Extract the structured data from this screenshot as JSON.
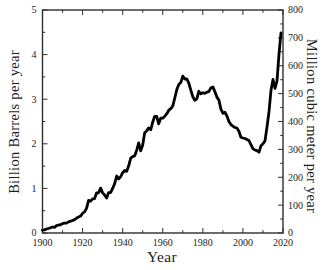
{
  "figure": {
    "xlabel": "Year",
    "ylabel_left": "Billion Barrels per year",
    "ylabel_right": "Million cubic meter per year",
    "colors": {
      "line": "#000000",
      "axis": "#2e2e2e",
      "text": "#1c1c1c",
      "background": "#ffffff"
    }
  },
  "chart_data": {
    "type": "line",
    "title": "",
    "xlabel": "Year",
    "ylabel_left": "Billion Barrels per year",
    "ylabel_right": "Million cubic meter per year",
    "xlim": [
      1900,
      2020
    ],
    "ylim_left": [
      0,
      5
    ],
    "ylim_right": [
      0,
      800
    ],
    "x_major_ticks": [
      1900,
      1920,
      1940,
      1960,
      1980,
      2000,
      2020
    ],
    "x_minor_step": 10,
    "left_major_ticks": [
      0,
      1,
      2,
      3,
      4,
      5
    ],
    "left_minor_step": 0.5,
    "right_major_ticks": [
      0,
      100,
      200,
      300,
      400,
      500,
      600,
      700,
      800
    ],
    "right_minor_step": 50,
    "grid": false,
    "legend": null,
    "series": [
      {
        "name": "oil-production",
        "x_start": 1900,
        "x_step": 1,
        "x_end": 2019,
        "values": [
          0.063,
          0.069,
          0.089,
          0.1,
          0.117,
          0.135,
          0.126,
          0.166,
          0.179,
          0.183,
          0.21,
          0.22,
          0.223,
          0.248,
          0.266,
          0.281,
          0.301,
          0.335,
          0.356,
          0.378,
          0.443,
          0.472,
          0.557,
          0.732,
          0.714,
          0.764,
          0.771,
          0.901,
          0.902,
          1.007,
          0.898,
          0.851,
          0.785,
          0.906,
          0.908,
          0.997,
          1.1,
          1.279,
          1.214,
          1.265,
          1.353,
          1.402,
          1.386,
          1.506,
          1.678,
          1.714,
          1.734,
          1.857,
          2.02,
          1.842,
          1.974,
          2.248,
          2.29,
          2.357,
          2.315,
          2.484,
          2.617,
          2.617,
          2.449,
          2.575,
          2.575,
          2.622,
          2.676,
          2.753,
          2.787,
          2.849,
          3.028,
          3.216,
          3.329,
          3.372,
          3.517,
          3.454,
          3.455,
          3.361,
          3.203,
          3.057,
          2.976,
          3.009,
          3.178,
          3.121,
          3.146,
          3.129,
          3.157,
          3.171,
          3.25,
          3.275,
          3.168,
          3.047,
          2.979,
          2.779,
          2.685,
          2.707,
          2.625,
          2.499,
          2.431,
          2.394,
          2.366,
          2.355,
          2.282,
          2.147,
          2.131,
          2.118,
          2.097,
          2.073,
          1.983,
          1.89,
          1.862,
          1.848,
          1.812,
          1.957,
          2.001,
          2.065,
          2.377,
          2.72,
          3.201,
          3.442,
          3.241,
          3.411,
          4.011,
          4.486
        ]
      }
    ]
  }
}
